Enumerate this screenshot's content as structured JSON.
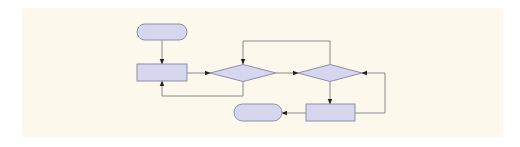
{
  "diagram": {
    "type": "flowchart",
    "background": "#ffffff",
    "panel": {
      "x": 22,
      "y": 8,
      "w": 481,
      "h": 129,
      "fill": "#fcf8ec"
    },
    "colors": {
      "shape_fill": "#d6d6ee",
      "shape_stroke": "#8e8ea8",
      "connector": "#8a8a8a",
      "arrowhead": "#222222"
    },
    "nodes": [
      {
        "id": "start",
        "kind": "terminal",
        "x": 137,
        "y": 24,
        "w": 50,
        "h": 16,
        "label": ""
      },
      {
        "id": "process1",
        "kind": "process",
        "x": 137,
        "y": 64,
        "w": 50,
        "h": 17,
        "label": ""
      },
      {
        "id": "decision1",
        "kind": "decision",
        "cx": 243,
        "cy": 73,
        "w": 66,
        "h": 17,
        "label": ""
      },
      {
        "id": "decision2",
        "kind": "decision",
        "cx": 330,
        "cy": 73,
        "w": 64,
        "h": 17,
        "label": ""
      },
      {
        "id": "process2",
        "kind": "process",
        "x": 306,
        "y": 104,
        "w": 49,
        "h": 17,
        "label": ""
      },
      {
        "id": "end",
        "kind": "terminal",
        "x": 234,
        "y": 104,
        "w": 48,
        "h": 17,
        "label": ""
      }
    ],
    "edges": [
      {
        "id": "start-to-process1",
        "points": [
          [
            162,
            40
          ],
          [
            162,
            64
          ]
        ],
        "arrow": "end"
      },
      {
        "id": "process1-to-decision1",
        "points": [
          [
            187,
            73
          ],
          [
            210,
            73
          ]
        ],
        "arrow": "end"
      },
      {
        "id": "decision1-to-decision2",
        "points": [
          [
            276,
            73
          ],
          [
            298,
            73
          ]
        ],
        "arrow": "end"
      },
      {
        "id": "decision1-loop-to-process1",
        "points": [
          [
            243,
            81
          ],
          [
            243,
            96
          ],
          [
            162,
            96
          ],
          [
            162,
            81
          ]
        ],
        "arrow": "end"
      },
      {
        "id": "decision2-loop-to-decision1",
        "points": [
          [
            330,
            64
          ],
          [
            330,
            41
          ],
          [
            243,
            41
          ],
          [
            243,
            64
          ]
        ],
        "arrow": "end"
      },
      {
        "id": "decision2-to-process2",
        "points": [
          [
            330,
            82
          ],
          [
            330,
            104
          ]
        ],
        "arrow": "end"
      },
      {
        "id": "process2-loop-to-decision2",
        "points": [
          [
            355,
            113
          ],
          [
            385,
            113
          ],
          [
            385,
            73
          ],
          [
            362,
            73
          ]
        ],
        "arrow": "end"
      },
      {
        "id": "process2-to-end",
        "points": [
          [
            306,
            113
          ],
          [
            282,
            113
          ]
        ],
        "arrow": "end"
      }
    ]
  }
}
